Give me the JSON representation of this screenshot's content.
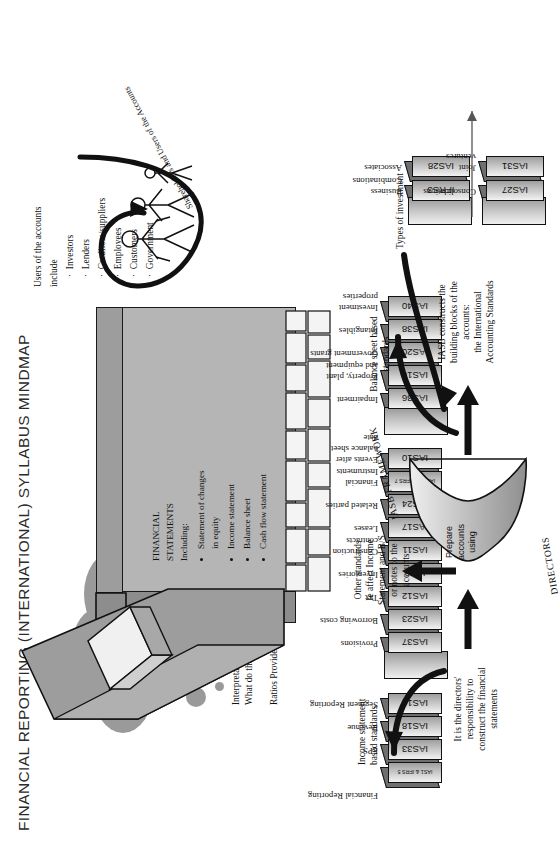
{
  "title": "FINANCIAL REPORTING (INTERNATIONAL) SYLLABUS MINDMAP",
  "cloud": {
    "line1": "Theoretical aspects:",
    "line2": "Agency theory",
    "line3": "Positive accounting concepts."
  },
  "interpretation": {
    "bubble_label": "ratios",
    "line1": "Interpretation",
    "line2": "What do the accounts tell us?",
    "line3": "Ratios Provide a tool to help us."
  },
  "users": {
    "heading": "Users of the accounts",
    "include_label": "include",
    "items": [
      "Investors",
      "Lenders",
      "Creditors/suppliers",
      "Employees",
      "Customers",
      "Government"
    ],
    "arrow_label": "Shareholders and Users of the Accounts"
  },
  "financial_statements": {
    "heading_line1": "FINANCIAL",
    "heading_line2": "STATEMENTS",
    "heading_line3": "Including:",
    "items": [
      "Statement of changes\nin equity",
      "Income statement",
      "Balance sheet",
      "Cash flow statement"
    ]
  },
  "directors": {
    "note": "It is the directors'\nresponsibility to\nconstruct the financial\nstatements",
    "funnel_text": "Prepare\naccounts\nusing",
    "funnel_label_bottom": "DIRECTORS",
    "funnel_label_top": "IASB FRAMEWORK",
    "iasb_note": "IASB constructs the\nbuilding blocks of the\naccounts:\nthe International\nAccounting Standards"
  },
  "branch_labels": {
    "income_statement_based": "Income statement\nbased standards",
    "other_standards": "Other standards\nIe affect Income\nStatement and B/S\nor notes to the\naccounts",
    "balance_sheet_based": "Balance sheet based\nstandards",
    "types_of_investment": "Types of investment"
  },
  "groups": [
    {
      "name": "income-statement-group",
      "header": "Financial Reporting",
      "standards": [
        {
          "code": "IAS1 & IFRS 5",
          "label": "",
          "small": true
        },
        {
          "code": "IAS33",
          "label": "EPS"
        },
        {
          "code": "IAS18",
          "label": "Revenue"
        },
        {
          "code": "IAS14",
          "label": "Segment Reporting"
        }
      ]
    },
    {
      "name": "other-standards-group",
      "header": "",
      "standards": [
        {
          "code": "IAS37",
          "label": "Provisions"
        },
        {
          "code": "IAS23",
          "label": "Borrowing costs"
        },
        {
          "code": "IAS12",
          "label": "Tax"
        },
        {
          "code": "IAS2",
          "label": "Inventories"
        },
        {
          "code": "IAS11",
          "label": "Construction\ncontracts"
        },
        {
          "code": "IAS17",
          "label": "Leases"
        },
        {
          "code": "IAS24",
          "label": "Related parties"
        },
        {
          "code": "IAS32/39 IFRS 7",
          "label": "Financial\nInstruments",
          "small": true
        },
        {
          "code": "IAS10",
          "label": "Events after\nbalance sheet\ndate"
        }
      ]
    },
    {
      "name": "balance-sheet-group",
      "header": "",
      "standards": [
        {
          "code": "IAS36",
          "label": "Impairment"
        },
        {
          "code": "IAS16",
          "label": "Property, plant\nand equipment"
        },
        {
          "code": "IAS20",
          "label": "Government grants"
        },
        {
          "code": "IAS38",
          "label": "Intangibles"
        },
        {
          "code": "IAS40",
          "label": "Investment\nproperties"
        }
      ]
    }
  ],
  "investments": {
    "group_a": [
      {
        "code": "IFRS3",
        "label": "Business\nCombinations"
      },
      {
        "code": "IAS28",
        "label": "Associates"
      }
    ],
    "group_b": [
      {
        "code": "IAS27",
        "label": "Consolidations"
      },
      {
        "code": "IAS31",
        "label": "Joint\nventures"
      }
    ]
  },
  "colors": {
    "cloud": "#9a9a9a",
    "carton_front": "#b5b5b5",
    "carton_top": "#9d9d9d",
    "ink": "#111111"
  }
}
